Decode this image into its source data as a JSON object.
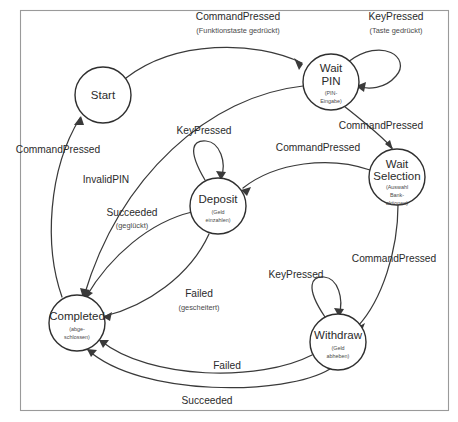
{
  "diagram": {
    "kind": "state-machine-diagram",
    "language": "English with German glosses",
    "border_color": "#9a9a9a",
    "node_stroke_color": "#2f2f2f",
    "edge_stroke_color": "#3a3a3a",
    "background_color": "#ffffff"
  },
  "states": [
    {
      "id": "start",
      "label": "Start",
      "sub_lines": [],
      "cx": 103,
      "cy": 95,
      "r": 28
    },
    {
      "id": "wait-pin",
      "label_lines": [
        "Wait",
        "PIN"
      ],
      "label": "Wait PIN",
      "sub_lines": [
        "(PIN-",
        "Eingabe)"
      ],
      "cx": 331,
      "cy": 82,
      "r": 28
    },
    {
      "id": "wait-selection",
      "label_lines": [
        "Wait",
        "Selection"
      ],
      "label": "Wait Selection",
      "sub_lines": [
        "(Auswahl",
        "Bank-",
        "aktionen)"
      ],
      "cx": 397,
      "cy": 177,
      "r": 28
    },
    {
      "id": "deposit",
      "label_lines": [
        "Deposit"
      ],
      "label": "Deposit",
      "sub_lines": [
        "(Geld",
        "einzahlen)"
      ],
      "cx": 218,
      "cy": 206,
      "r": 28
    },
    {
      "id": "completed",
      "label_lines": [
        "Completed"
      ],
      "label": "Completed",
      "sub_lines": [
        "(abge-",
        "schlossen)"
      ],
      "cx": 77,
      "cy": 323,
      "r": 28
    },
    {
      "id": "withdraw",
      "label_lines": [
        "Withdraw"
      ],
      "label": "Withdraw",
      "sub_lines": [
        "(Geld",
        "abheben)"
      ],
      "cx": 338,
      "cy": 342,
      "r": 28
    }
  ],
  "transitions": [
    {
      "id": "t-start-to-waitpin",
      "from": "start",
      "to": "wait-pin",
      "label": "CommandPressed",
      "sub": "(Funktionstaste gedrückt)",
      "label_x": 238,
      "label_y": 17,
      "sub_x": 238,
      "sub_y": 31
    },
    {
      "id": "t-waitpin-self",
      "from": "wait-pin",
      "to": "wait-pin",
      "label": "KeyPressed",
      "sub": "(Taste gedrückt)",
      "label_x": 396,
      "label_y": 17,
      "sub_x": 396,
      "sub_y": 31
    },
    {
      "id": "t-waitpin-to-waitselection",
      "from": "wait-pin",
      "to": "wait-selection",
      "label": "CommandPressed",
      "sub": "",
      "label_x": 381,
      "label_y": 126,
      "sub_x": 0,
      "sub_y": 0
    },
    {
      "id": "t-waitselection-to-deposit",
      "from": "wait-selection",
      "to": "deposit",
      "label": "CommandPressed",
      "sub": "",
      "label_x": 318,
      "label_y": 148,
      "sub_x": 0,
      "sub_y": 0
    },
    {
      "id": "t-waitselection-to-withdraw",
      "from": "wait-selection",
      "to": "withdraw",
      "label": "CommandPressed",
      "sub": "",
      "label_x": 394,
      "label_y": 259,
      "sub_x": 0,
      "sub_y": 0
    },
    {
      "id": "t-completed-to-start",
      "from": "completed",
      "to": "start",
      "label": "CommandPressed",
      "sub": "",
      "label_x": 58,
      "label_y": 150,
      "sub_x": 0,
      "sub_y": 0
    },
    {
      "id": "t-waitpin-to-completed",
      "from": "wait-pin",
      "to": "completed",
      "label": "InvalidPIN",
      "sub": "",
      "label_x": 106,
      "label_y": 180,
      "sub_x": 0,
      "sub_y": 0
    },
    {
      "id": "t-deposit-self",
      "from": "deposit",
      "to": "deposit",
      "label": "KeyPressed",
      "sub": "",
      "label_x": 204,
      "label_y": 131,
      "sub_x": 0,
      "sub_y": 0
    },
    {
      "id": "t-deposit-to-completed-succeeded",
      "from": "deposit",
      "to": "completed",
      "label": "Succeeded",
      "sub": "(geglückt)",
      "label_x": 132,
      "label_y": 213,
      "sub_x": 132,
      "sub_y": 226
    },
    {
      "id": "t-deposit-to-completed-failed",
      "from": "deposit",
      "to": "completed",
      "label": "Failed",
      "sub": "(gescheitert)",
      "label_x": 199,
      "label_y": 294,
      "sub_x": 199,
      "sub_y": 308
    },
    {
      "id": "t-withdraw-self",
      "from": "withdraw",
      "to": "withdraw",
      "label": "KeyPressed",
      "sub": "",
      "label_x": 296,
      "label_y": 275,
      "sub_x": 0,
      "sub_y": 0
    },
    {
      "id": "t-withdraw-to-completed-failed",
      "from": "withdraw",
      "to": "completed",
      "label": "Failed",
      "sub": "",
      "label_x": 227,
      "label_y": 366,
      "sub_x": 0,
      "sub_y": 0
    },
    {
      "id": "t-withdraw-to-completed-succeeded",
      "from": "withdraw",
      "to": "completed",
      "label": "Succeeded",
      "sub": "",
      "label_x": 207,
      "label_y": 401,
      "sub_x": 0,
      "sub_y": 0
    }
  ]
}
